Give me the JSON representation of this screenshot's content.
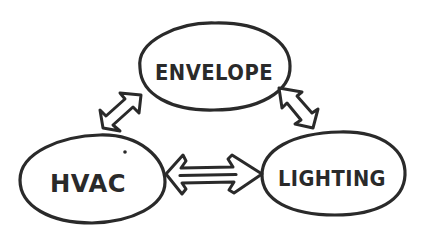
{
  "diagram": {
    "type": "hand-drawn concept diagram",
    "colors": {
      "ink": "#2a2a2a",
      "background": "#ffffff"
    },
    "nodes": [
      {
        "id": "envelope",
        "label": "ENVELOPE",
        "position": "top-center"
      },
      {
        "id": "hvac",
        "label": "HVAC",
        "position": "bottom-left"
      },
      {
        "id": "lighting",
        "label": "LIGHTING",
        "position": "bottom-right"
      }
    ],
    "edges": [
      {
        "from": "envelope",
        "to": "hvac",
        "direction": "bidirectional"
      },
      {
        "from": "envelope",
        "to": "lighting",
        "direction": "bidirectional"
      },
      {
        "from": "hvac",
        "to": "lighting",
        "direction": "bidirectional"
      }
    ]
  }
}
